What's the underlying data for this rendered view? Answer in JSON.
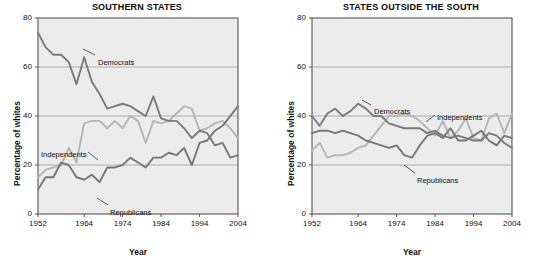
{
  "figure": {
    "background_color": "#ffffff",
    "plot_background_color": "#ececec",
    "axis_color": "#555555",
    "grid_color": "#a8a8a8"
  },
  "series_colors": {
    "democrats": "#7a7a7a",
    "republicans": "#767676",
    "independents": "#b5b5b5"
  },
  "panels": [
    {
      "key": "south",
      "title": "SOUTHERN STATES",
      "xlabel": "Year",
      "ylabel": "Percentage of whites",
      "annotations": [
        {
          "name": "democrats-label",
          "text": "Democrats"
        },
        {
          "name": "independents-label",
          "text": "Independents"
        },
        {
          "name": "republicans-label",
          "text": "Republicans"
        }
      ]
    },
    {
      "key": "nonsouth",
      "title": "STATES OUTSIDE THE SOUTH",
      "xlabel": "Year",
      "ylabel": "Percentage of whites",
      "annotations": [
        {
          "name": "democrats-label",
          "text": "Democrats"
        },
        {
          "name": "independents-label",
          "text": "Independents"
        },
        {
          "name": "republicans-label",
          "text": "Republicans"
        }
      ]
    }
  ],
  "axis": {
    "ytick_labels": [
      "0",
      "20",
      "40",
      "60",
      "80"
    ],
    "ytick_values": [
      0,
      20,
      40,
      60,
      80
    ],
    "xtick_labels": [
      "1952",
      "1964",
      "1974",
      "1984",
      "1994",
      "2004"
    ],
    "xtick_values": [
      1952,
      1964,
      1974,
      1984,
      1994,
      2004
    ],
    "ylim": [
      0,
      80
    ],
    "xlim": [
      1952,
      2004
    ]
  },
  "chart_data": [
    {
      "type": "line",
      "title": "SOUTHERN STATES",
      "xlabel": "Year",
      "ylabel": "Percentage of whites",
      "ylim": [
        0,
        80
      ],
      "xlim": [
        1952,
        2004
      ],
      "grid": true,
      "legend": "inline-annotations",
      "x": [
        1952,
        1954,
        1956,
        1958,
        1960,
        1962,
        1964,
        1966,
        1968,
        1970,
        1972,
        1974,
        1976,
        1978,
        1980,
        1982,
        1984,
        1986,
        1988,
        1990,
        1992,
        1994,
        1996,
        1998,
        2000,
        2002,
        2004
      ],
      "series": [
        {
          "name": "Democrats",
          "color": "#7a7a7a",
          "values": [
            74,
            68,
            65,
            65,
            62,
            53,
            64,
            54,
            49,
            43,
            44,
            45,
            44,
            42,
            40,
            48,
            39,
            38,
            38,
            35,
            31,
            34,
            33,
            28,
            29,
            23,
            24
          ]
        },
        {
          "name": "Independents",
          "color": "#b5b5b5",
          "values": [
            15,
            18,
            19,
            20,
            27,
            21,
            37,
            38,
            38,
            35,
            38,
            35,
            40,
            38,
            29,
            38,
            37,
            38,
            41,
            44,
            43,
            34,
            35,
            37,
            38,
            35,
            31
          ]
        },
        {
          "name": "Republicans",
          "color": "#767676",
          "values": [
            10,
            15,
            15,
            21,
            20,
            15,
            14,
            16,
            13,
            19,
            19,
            20,
            23,
            21,
            19,
            23,
            23,
            25,
            24,
            27,
            20,
            29,
            30,
            34,
            36,
            40,
            44
          ]
        }
      ]
    },
    {
      "type": "line",
      "title": "STATES OUTSIDE THE SOUTH",
      "xlabel": "Year",
      "ylabel": "Percentage of whites",
      "ylim": [
        0,
        80
      ],
      "xlim": [
        1952,
        2004
      ],
      "grid": true,
      "legend": "inline-annotations",
      "x": [
        1952,
        1954,
        1956,
        1958,
        1960,
        1962,
        1964,
        1966,
        1968,
        1970,
        1972,
        1974,
        1976,
        1978,
        1980,
        1982,
        1984,
        1986,
        1988,
        1990,
        1992,
        1994,
        1996,
        1998,
        2000,
        2002,
        2004
      ],
      "series": [
        {
          "name": "Democrats",
          "color": "#7a7a7a",
          "values": [
            40,
            36,
            41,
            43,
            40,
            42,
            45,
            43,
            40,
            40,
            37,
            36,
            35,
            35,
            35,
            33,
            34,
            32,
            31,
            32,
            31,
            30,
            30,
            33,
            32,
            29,
            27
          ]
        },
        {
          "name": "Independents",
          "color": "#b5b5b5",
          "values": [
            26,
            29,
            23,
            24,
            24,
            25,
            27,
            28,
            32,
            36,
            40,
            40,
            41,
            40,
            38,
            35,
            32,
            38,
            31,
            34,
            39,
            31,
            30,
            39,
            41,
            33,
            41
          ]
        },
        {
          "name": "Republicans",
          "color": "#767676",
          "values": [
            33,
            34,
            34,
            33,
            34,
            33,
            32,
            30,
            29,
            28,
            27,
            28,
            24,
            23,
            28,
            32,
            33,
            31,
            35,
            30,
            30,
            32,
            34,
            30,
            28,
            32,
            31
          ]
        }
      ]
    }
  ]
}
